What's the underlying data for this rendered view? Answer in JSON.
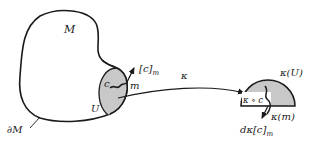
{
  "diagram": {
    "manifold": {
      "label": "M",
      "boundary_label": "∂M",
      "neighborhood_label": "U",
      "curve_label": "c",
      "point_label": "m",
      "tangent_label": "[c]",
      "tangent_subscript": "m"
    },
    "map": {
      "label": "κ"
    },
    "image": {
      "region_label": "κ(U)",
      "curve_label": "κ ∘ c",
      "point_label": "κ(m)",
      "tangent_label": "dκ[c]",
      "tangent_subscript": "m"
    },
    "colors": {
      "stroke": "#1a1a1a",
      "shade": "#c8c8c8",
      "background": "#ffffff"
    }
  }
}
